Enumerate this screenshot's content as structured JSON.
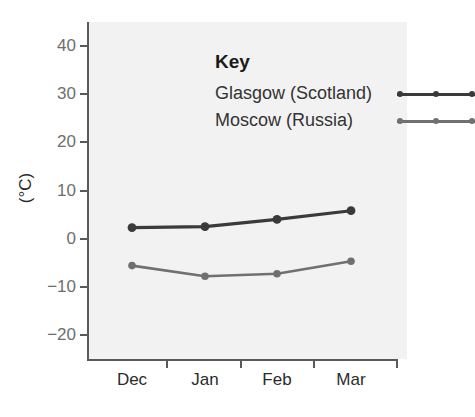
{
  "chart_data": {
    "type": "line",
    "title": "",
    "xlabel": "",
    "ylabel": "(°C)",
    "categories": [
      "Dec",
      "Jan",
      "Feb",
      "Mar"
    ],
    "ylim": [
      -25,
      45
    ],
    "yticks": [
      40,
      30,
      20,
      10,
      0,
      -10,
      -20
    ],
    "ytick_labels": [
      "40",
      "30",
      "20",
      "10",
      "0",
      "−10",
      "−20"
    ],
    "grid": false,
    "legend_position": "top-left-inside",
    "legend_title": "Key",
    "series": [
      {
        "name": "Glasgow (Scotland)",
        "color": "#3a3a3a",
        "values": [
          2.3,
          2.5,
          4.0,
          5.8
        ]
      },
      {
        "name": "Moscow (Russia)",
        "color": "#707070",
        "values": [
          -5.6,
          -7.8,
          -7.3,
          -4.7
        ]
      }
    ]
  },
  "axes": {
    "y_title": "(°C)",
    "y_tick_labels": [
      "40",
      "30",
      "20",
      "10",
      "0",
      "−10",
      "−20"
    ],
    "x_tick_labels": [
      "Dec",
      "Jan",
      "Feb",
      "Mar"
    ]
  },
  "legend": {
    "title": "Key",
    "entries": [
      {
        "label": "Glasgow (Scotland)",
        "color": "#3a3a3a"
      },
      {
        "label": "Moscow (Russia)",
        "color": "#707070"
      }
    ]
  },
  "colors": {
    "plot_background": "#f2f2f2",
    "page_background": "#ffffff",
    "axis": "#5a5a5a",
    "tick_label": "#6e6e6e",
    "series_1": "#3a3a3a",
    "series_2": "#707070"
  }
}
